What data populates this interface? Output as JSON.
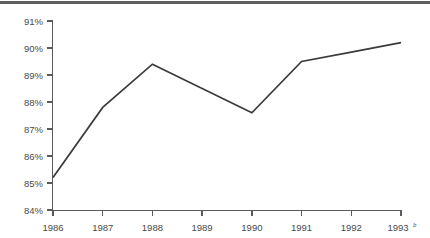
{
  "chart_data": {
    "type": "line",
    "title": "",
    "subtitle": "",
    "xlabel": "",
    "ylabel": "",
    "categories": [
      "1986",
      "1987",
      "1988",
      "1989",
      "1990",
      "1991",
      "1992",
      "1993"
    ],
    "x_tick_labels": [
      "1986",
      "1987",
      "1988",
      "1989",
      "1990",
      "1991",
      "1992",
      "1993"
    ],
    "x_tick_superscripts": [
      "",
      "",
      "",
      "",
      "",
      "",
      "",
      "b"
    ],
    "values": [
      85.2,
      87.8,
      89.4,
      88.5,
      87.6,
      89.5,
      89.85,
      90.2
    ],
    "series": [
      {
        "name": "",
        "values": [
          85.2,
          87.8,
          89.4,
          88.5,
          87.6,
          89.5,
          89.85,
          90.2
        ]
      }
    ],
    "y_tick_labels": [
      "91%",
      "90%",
      "89%",
      "88%",
      "87%",
      "86%",
      "85%",
      "84%"
    ],
    "y_tick_values": [
      91,
      90,
      89,
      88,
      87,
      86,
      85,
      84
    ],
    "ylim": [
      84,
      91
    ],
    "xlim_index": [
      0,
      7
    ],
    "grid": false,
    "legend": null,
    "legend_position": "none",
    "line_color": "#3b3b3b",
    "axis_color": "#5a5a5a",
    "text_color": "#4a4a4a",
    "background_color": "#ffffff",
    "top_rule_color": "#5e5e5e"
  },
  "figure": {
    "has_top_rule": true,
    "has_right_axis": false,
    "has_top_axis": false
  }
}
